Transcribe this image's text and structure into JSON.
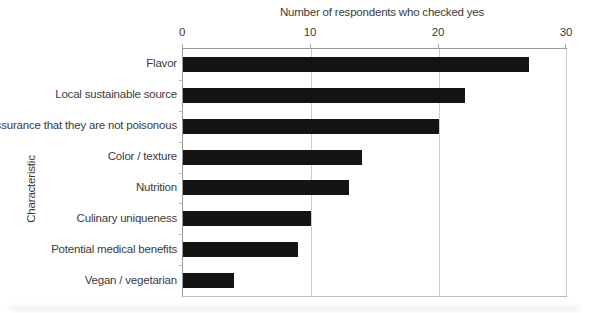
{
  "chart_data": {
    "type": "bar",
    "orientation": "horizontal",
    "title": "Number of respondents who checked yes",
    "xlabel": "Number of respondents who checked yes",
    "ylabel": "Characteristic",
    "categories": [
      "Flavor",
      "Local sustainable source",
      "Assurance that they are not poisonous",
      "Color / texture",
      "Nutrition",
      "Culinary uniqueness",
      "Potential medical benefits",
      "Vegan / vegetarian"
    ],
    "values": [
      27,
      22,
      20,
      14,
      13,
      10,
      9,
      4
    ],
    "xlim": [
      0,
      30
    ],
    "xticks": [
      0,
      10,
      20,
      30
    ],
    "grid": "vertical-gridlines-at-ticks",
    "legend": "none",
    "bar_color": "#141414",
    "axis_color": "#999999",
    "grid_color": "#cccccc",
    "text_color": "#3b3b3b"
  }
}
